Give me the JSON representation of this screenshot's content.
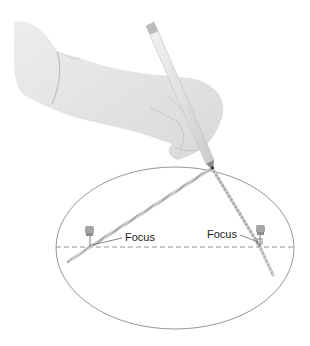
{
  "diagram": {
    "labels": {
      "focus_left": "Focus",
      "focus_right": "Focus"
    },
    "ellipse": {
      "cx": 175,
      "cy": 248,
      "rx": 119,
      "ry": 81,
      "stroke": "#8a8a8a"
    },
    "major_axis": {
      "y": 247,
      "x1": 56,
      "x2": 294,
      "style": "dashed",
      "stroke": "#8a8a8a"
    },
    "foci": [
      {
        "name": "left",
        "x": 90,
        "y": 247
      },
      {
        "name": "right",
        "x": 260,
        "y": 247
      }
    ],
    "pencil_tip": {
      "x": 212,
      "y": 168
    },
    "colors": {
      "glove": "#e6e6e6",
      "glove_shadow": "#cfcfcf",
      "string": "#b8b8b8",
      "pin": "#9a9a9a"
    }
  }
}
